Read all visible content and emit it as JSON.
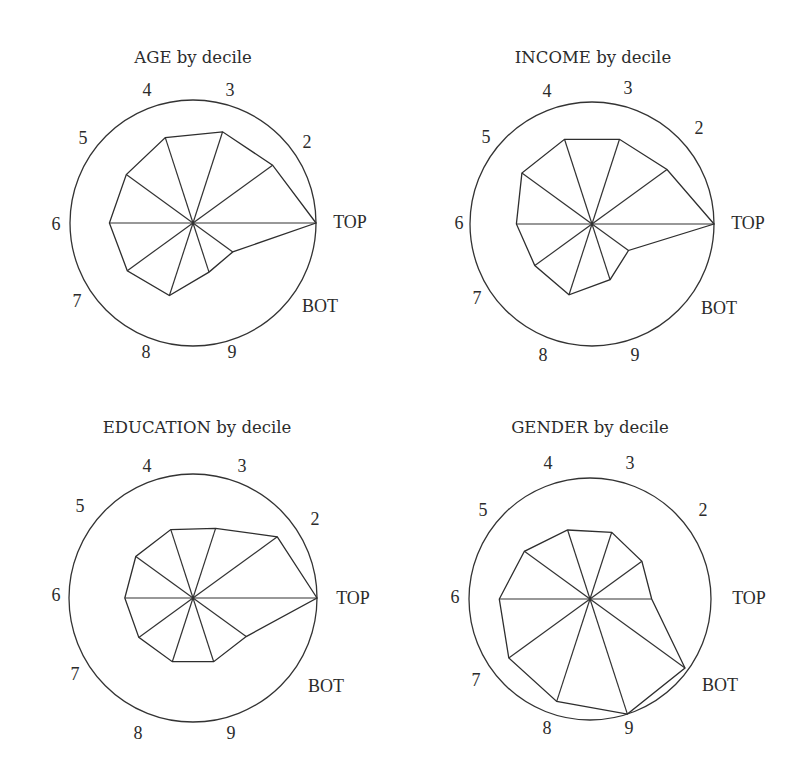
{
  "figure": {
    "colors": {
      "line": "#333333",
      "text": "#2b2b2b",
      "background": "#ffffff"
    }
  },
  "chart_data": [
    {
      "type": "radar",
      "title": "AGE by decile",
      "categories": [
        "TOP",
        "2",
        "3",
        "4",
        "5",
        "6",
        "7",
        "8",
        "9",
        "BOT"
      ],
      "values": [
        1.0,
        0.8,
        0.78,
        0.73,
        0.67,
        0.68,
        0.66,
        0.62,
        0.42,
        0.4
      ],
      "rlim": [
        0,
        1
      ],
      "grid": false,
      "layout": {
        "cx": 193,
        "cy": 223,
        "r": 123,
        "title_pos": [
          193,
          58
        ],
        "label_pos": [
          [
            350,
            224
          ],
          [
            307,
            144
          ],
          [
            230,
            92
          ],
          [
            147,
            92
          ],
          [
            83,
            140
          ],
          [
            56,
            226
          ],
          [
            77,
            303
          ],
          [
            146,
            354
          ],
          [
            232,
            354
          ],
          [
            320,
            308
          ]
        ]
      }
    },
    {
      "type": "radar",
      "title": "INCOME by decile",
      "categories": [
        "TOP",
        "2",
        "3",
        "4",
        "5",
        "6",
        "7",
        "8",
        "9",
        "BOT"
      ],
      "values": [
        1.0,
        0.76,
        0.73,
        0.73,
        0.71,
        0.62,
        0.58,
        0.61,
        0.48,
        0.37
      ],
      "rlim": [
        0,
        1
      ],
      "grid": false,
      "layout": {
        "cx": 592,
        "cy": 224,
        "r": 122,
        "title_pos": [
          593,
          58
        ],
        "label_pos": [
          [
            748,
            225
          ],
          [
            699,
            130
          ],
          [
            628,
            90
          ],
          [
            547,
            93
          ],
          [
            486,
            139
          ],
          [
            459,
            225
          ],
          [
            477,
            300
          ],
          [
            543,
            357
          ],
          [
            635,
            357
          ],
          [
            719,
            310
          ]
        ]
      }
    },
    {
      "type": "radar",
      "title": "EDUCATION by decile",
      "categories": [
        "TOP",
        "2",
        "3",
        "4",
        "5",
        "6",
        "7",
        "8",
        "9",
        "BOT"
      ],
      "values": [
        1.0,
        0.84,
        0.59,
        0.58,
        0.57,
        0.55,
        0.54,
        0.54,
        0.54,
        0.53
      ],
      "rlim": [
        0,
        1
      ],
      "grid": false,
      "layout": {
        "cx": 193,
        "cy": 598,
        "r": 124,
        "title_pos": [
          197,
          428
        ],
        "label_pos": [
          [
            353,
            600
          ],
          [
            315,
            521
          ],
          [
            242,
            468
          ],
          [
            147,
            468
          ],
          [
            80,
            508
          ],
          [
            56,
            597
          ],
          [
            75,
            676
          ],
          [
            138,
            735
          ],
          [
            231,
            735
          ],
          [
            326,
            688
          ]
        ]
      }
    },
    {
      "type": "radar",
      "title": "GENDER by decile",
      "categories": [
        "TOP",
        "2",
        "3",
        "4",
        "5",
        "6",
        "7",
        "8",
        "9",
        "BOT"
      ],
      "values": [
        0.51,
        0.53,
        0.58,
        0.6,
        0.67,
        0.75,
        0.83,
        0.89,
        1.0,
        0.97
      ],
      "rlim": [
        0,
        1
      ],
      "grid": false,
      "layout": {
        "cx": 590,
        "cy": 599,
        "r": 121,
        "title_pos": [
          590,
          428
        ],
        "label_pos": [
          [
            749,
            600
          ],
          [
            703,
            512
          ],
          [
            630,
            465
          ],
          [
            548,
            465
          ],
          [
            483,
            512
          ],
          [
            455,
            599
          ],
          [
            476,
            682
          ],
          [
            547,
            730
          ],
          [
            629,
            730
          ],
          [
            720,
            687
          ]
        ]
      }
    }
  ]
}
